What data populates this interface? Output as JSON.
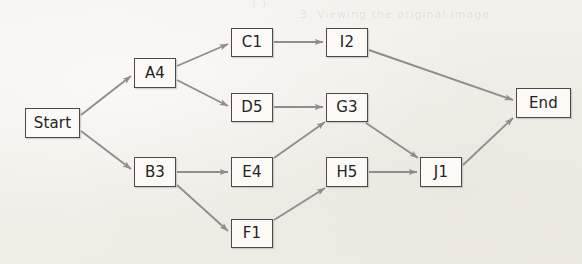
{
  "diagram": {
    "type": "flowchart",
    "title": "",
    "orientation": "left-to-right",
    "background_color": "#f3f1ec",
    "node_fill_color": "#fbfaf7",
    "node_border_color": "#4a4a4a",
    "edge_color": "#8e8e8e",
    "nodes": [
      {
        "id": "start",
        "label": "Start",
        "x": 25,
        "y": 108,
        "w": 55,
        "h": 30
      },
      {
        "id": "a4",
        "label": "A4",
        "x": 134,
        "y": 58,
        "w": 42,
        "h": 30
      },
      {
        "id": "b3",
        "label": "B3",
        "x": 134,
        "y": 157,
        "w": 42,
        "h": 30
      },
      {
        "id": "c1",
        "label": "C1",
        "x": 231,
        "y": 28,
        "w": 42,
        "h": 29
      },
      {
        "id": "d5",
        "label": "D5",
        "x": 231,
        "y": 93,
        "w": 42,
        "h": 29
      },
      {
        "id": "e4",
        "label": "E4",
        "x": 231,
        "y": 157,
        "w": 42,
        "h": 30
      },
      {
        "id": "f1",
        "label": "F1",
        "x": 231,
        "y": 219,
        "w": 42,
        "h": 29
      },
      {
        "id": "i2",
        "label": "I2",
        "x": 326,
        "y": 28,
        "w": 42,
        "h": 29
      },
      {
        "id": "g3",
        "label": "G3",
        "x": 326,
        "y": 93,
        "w": 42,
        "h": 29
      },
      {
        "id": "h5",
        "label": "H5",
        "x": 326,
        "y": 157,
        "w": 42,
        "h": 30
      },
      {
        "id": "j1",
        "label": "J1",
        "x": 420,
        "y": 157,
        "w": 42,
        "h": 30
      },
      {
        "id": "end",
        "label": "End",
        "x": 516,
        "y": 88,
        "w": 55,
        "h": 30
      }
    ],
    "edges": [
      {
        "from": "start",
        "to": "a4",
        "x1": 81,
        "y1": 115,
        "x2": 131,
        "y2": 76
      },
      {
        "from": "start",
        "to": "b3",
        "x1": 81,
        "y1": 131,
        "x2": 131,
        "y2": 169
      },
      {
        "from": "a4",
        "to": "c1",
        "x1": 177,
        "y1": 66,
        "x2": 228,
        "y2": 44
      },
      {
        "from": "a4",
        "to": "d5",
        "x1": 177,
        "y1": 80,
        "x2": 228,
        "y2": 106
      },
      {
        "from": "b3",
        "to": "e4",
        "x1": 177,
        "y1": 172,
        "x2": 228,
        "y2": 172
      },
      {
        "from": "b3",
        "to": "f1",
        "x1": 177,
        "y1": 185,
        "x2": 228,
        "y2": 231
      },
      {
        "from": "c1",
        "to": "i2",
        "x1": 274,
        "y1": 42,
        "x2": 323,
        "y2": 42
      },
      {
        "from": "d5",
        "to": "g3",
        "x1": 274,
        "y1": 107,
        "x2": 323,
        "y2": 107
      },
      {
        "from": "e4",
        "to": "g3",
        "x1": 274,
        "y1": 158,
        "x2": 325,
        "y2": 122
      },
      {
        "from": "f1",
        "to": "h5",
        "x1": 274,
        "y1": 220,
        "x2": 325,
        "y2": 188
      },
      {
        "from": "i2",
        "to": "end",
        "x1": 369,
        "y1": 50,
        "x2": 513,
        "y2": 100
      },
      {
        "from": "g3",
        "to": "j1",
        "x1": 366,
        "y1": 123,
        "x2": 418,
        "y2": 158
      },
      {
        "from": "h5",
        "to": "j1",
        "x1": 369,
        "y1": 172,
        "x2": 417,
        "y2": 172
      },
      {
        "from": "j1",
        "to": "end",
        "x1": 463,
        "y1": 165,
        "x2": 513,
        "y2": 118
      }
    ],
    "bleed_through_artifacts": [
      {
        "text": "( )",
        "x": 252,
        "y": -3
      },
      {
        "text": "3. Viewing the original image",
        "x": 300,
        "y": 8
      }
    ]
  }
}
